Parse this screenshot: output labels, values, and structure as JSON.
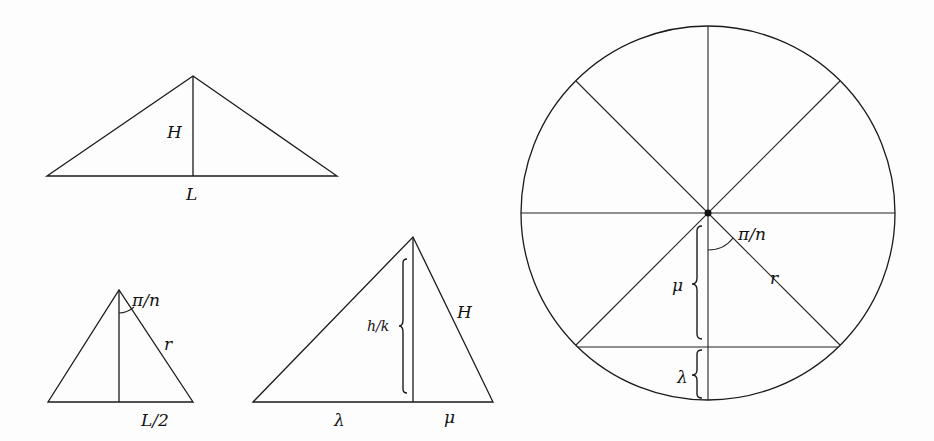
{
  "diagram": {
    "triangle_top": {
      "vertices": [
        [
          47,
          176
        ],
        [
          193,
          76
        ],
        [
          337,
          176
        ]
      ],
      "altitude": [
        [
          193,
          76
        ],
        [
          193,
          176
        ]
      ],
      "labels": {
        "height": "H",
        "base": "L"
      }
    },
    "triangle_small": {
      "vertices": [
        [
          48,
          402
        ],
        [
          119,
          290
        ],
        [
          193,
          402
        ]
      ],
      "altitude": [
        [
          119,
          290
        ],
        [
          119,
          402
        ]
      ],
      "labels": {
        "angle": "π/n",
        "side": "r",
        "half_base": "L/2"
      }
    },
    "triangle_middle": {
      "vertices": [
        [
          253,
          402
        ],
        [
          413,
          237
        ],
        [
          493,
          402
        ]
      ],
      "altitude": [
        [
          413,
          237
        ],
        [
          413,
          402
        ]
      ],
      "labels": {
        "altitude": "h/k",
        "side": "H",
        "left_segment": "λ",
        "right_segment": "μ"
      }
    },
    "circle": {
      "center": [
        708,
        213
      ],
      "radius": 187,
      "spokes": 8,
      "labels": {
        "angle": "π/n",
        "radius": "r",
        "upper_segment": "μ",
        "lower_segment": "λ"
      }
    }
  }
}
